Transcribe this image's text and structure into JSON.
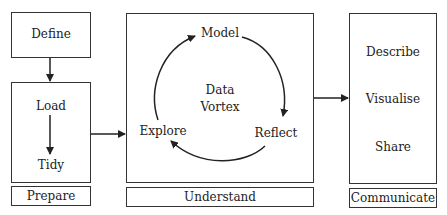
{
  "prepare": {
    "define": "Define",
    "load": "Load",
    "tidy": "Tidy",
    "caption": "Prepare"
  },
  "understand": {
    "center_line1": "Data",
    "center_line2": "Vortex",
    "model": "Model",
    "reflect": "Reflect",
    "explore": "Explore",
    "caption": "Understand"
  },
  "communicate": {
    "describe": "Describe",
    "visualise": "Visualise",
    "share": "Share",
    "caption": "Communicate"
  },
  "colors": {
    "stroke": "#333333",
    "text": "#222222",
    "background": "#ffffff"
  }
}
